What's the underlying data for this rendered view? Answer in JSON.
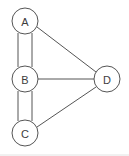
{
  "diagram": {
    "background_color": "#ffffff",
    "stroke_color": "#555555",
    "node_fill_color": "#ffffff",
    "label_color": "#3d3d3d",
    "frame_color": "#e2e2e2",
    "node_radius": 13,
    "nodes": [
      {
        "id": "A",
        "label": "A",
        "cx": 25,
        "cy": 21
      },
      {
        "id": "B",
        "label": "B",
        "cx": 25,
        "cy": 79
      },
      {
        "id": "C",
        "label": "C",
        "cx": 25,
        "cy": 133
      },
      {
        "id": "D",
        "label": "D",
        "cx": 107,
        "cy": 79
      }
    ],
    "edges": [
      {
        "id": "A-B-1",
        "from": "A",
        "to": "B",
        "kind": "parallel",
        "x1": 18,
        "y1": 33,
        "x2": 18,
        "y2": 67
      },
      {
        "id": "A-B-2",
        "from": "A",
        "to": "B",
        "kind": "parallel",
        "x1": 32,
        "y1": 33,
        "x2": 32,
        "y2": 67
      },
      {
        "id": "B-C-1",
        "from": "B",
        "to": "C",
        "kind": "parallel",
        "x1": 18,
        "y1": 91,
        "x2": 18,
        "y2": 121
      },
      {
        "id": "B-C-2",
        "from": "B",
        "to": "C",
        "kind": "parallel",
        "x1": 32,
        "y1": 91,
        "x2": 32,
        "y2": 121
      },
      {
        "id": "A-D",
        "from": "A",
        "to": "D",
        "kind": "single",
        "x1": 37,
        "y1": 27,
        "x2": 96,
        "y2": 72
      },
      {
        "id": "B-D",
        "from": "B",
        "to": "D",
        "kind": "single",
        "x1": 38,
        "y1": 79,
        "x2": 94,
        "y2": 79
      },
      {
        "id": "C-D",
        "from": "C",
        "to": "D",
        "kind": "single",
        "x1": 37,
        "y1": 127,
        "x2": 96,
        "y2": 87
      }
    ],
    "frame": {
      "x1": 0,
      "y1": 155,
      "x2": 129,
      "y2": 155
    }
  }
}
